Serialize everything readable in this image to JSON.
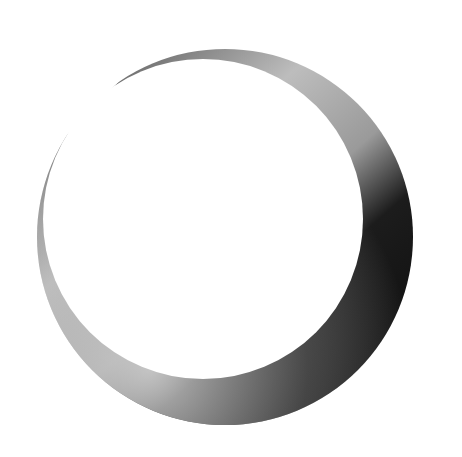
{
  "image": {
    "subject": "crescent-moon-brushstroke",
    "background": "#ffffff",
    "colors": {
      "light": "#d8d8d8",
      "mid": "#8a8a8a",
      "dark": "#1a1a1a",
      "edge": "#555555"
    }
  }
}
